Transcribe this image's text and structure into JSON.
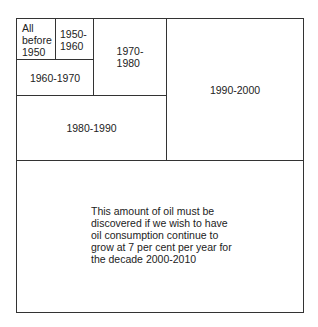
{
  "diagram": {
    "type": "nested-area",
    "regions": [
      {
        "id": "before-1950",
        "label": [
          "All",
          "before",
          "1950"
        ]
      },
      {
        "id": "1950-1960",
        "label": [
          "1950-",
          "1960"
        ]
      },
      {
        "id": "1960-1970",
        "label": [
          "1960-1970"
        ]
      },
      {
        "id": "1970-1980",
        "label": [
          "1970-",
          "1980"
        ]
      },
      {
        "id": "1980-1990",
        "label": [
          "1980-1990"
        ]
      },
      {
        "id": "1990-2000",
        "label": [
          "1990-2000"
        ]
      },
      {
        "id": "2000-2010",
        "label": [
          "This amount of oil must be",
          "discovered if we wish to have",
          "oil consumption continue to",
          "grow at 7 per cent per year for",
          "the decade 2000-2010"
        ]
      }
    ]
  }
}
